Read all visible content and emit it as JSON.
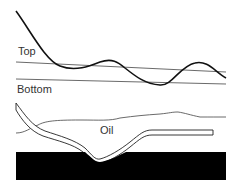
{
  "labels": {
    "top": "Top",
    "bottom": "Bottom",
    "oil": "Oil"
  },
  "colors": {
    "line": "#111111",
    "thin_line": "#444444",
    "bedrock": "#000000",
    "background": "#ffffff"
  }
}
